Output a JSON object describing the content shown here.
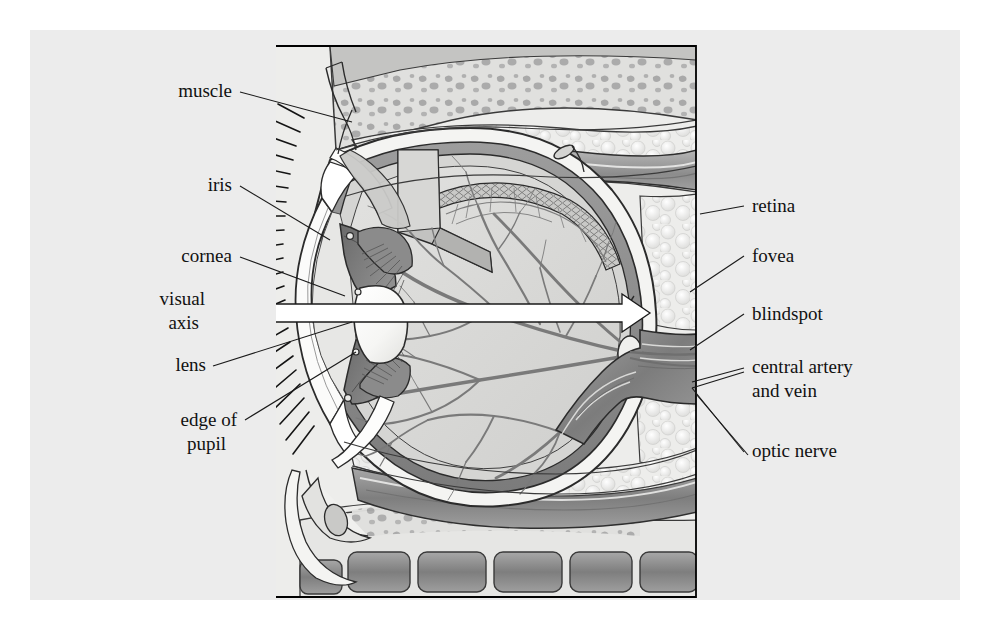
{
  "figure": {
    "background_color": "#ececec",
    "page_color": "#ffffff",
    "frame_color": "#000000",
    "frame": {
      "x": 275,
      "y": 45,
      "width": 422,
      "height": 553
    }
  },
  "labels": {
    "left": [
      {
        "id": "muscle",
        "text": "muscle",
        "x": 232,
        "y": 97,
        "align": "end"
      },
      {
        "id": "iris",
        "text": "iris",
        "x": 232,
        "y": 191,
        "align": "end"
      },
      {
        "id": "cornea",
        "text": "cornea",
        "x": 232,
        "y": 262,
        "align": "end"
      },
      {
        "id": "visual-axis-1",
        "text": "visual",
        "x": 205,
        "y": 305,
        "align": "end"
      },
      {
        "id": "visual-axis-2",
        "text": "axis",
        "x": 199,
        "y": 329,
        "align": "end"
      },
      {
        "id": "lens",
        "text": "lens",
        "x": 206,
        "y": 371,
        "align": "end"
      },
      {
        "id": "edge-of-pupil-1",
        "text": "edge of",
        "x": 237,
        "y": 426,
        "align": "end"
      },
      {
        "id": "edge-of-pupil-2",
        "text": "pupil",
        "x": 226,
        "y": 450,
        "align": "end"
      }
    ],
    "right": [
      {
        "id": "retina",
        "text": "retina",
        "x": 752,
        "y": 212,
        "align": "start"
      },
      {
        "id": "fovea",
        "text": "fovea",
        "x": 752,
        "y": 262,
        "align": "start"
      },
      {
        "id": "blindspot",
        "text": "blindspot",
        "x": 752,
        "y": 320,
        "align": "start"
      },
      {
        "id": "central-artery-1",
        "text": "central artery",
        "x": 752,
        "y": 373,
        "align": "start"
      },
      {
        "id": "central-artery-2",
        "text": "and vein",
        "x": 752,
        "y": 397,
        "align": "start"
      },
      {
        "id": "optic-nerve",
        "text": "optic nerve",
        "x": 752,
        "y": 457,
        "align": "start"
      }
    ]
  },
  "anatomy": {
    "visual_axis_arrow": {
      "name": "visual-axis-arrow",
      "fill": "#ffffff",
      "stroke": "#1a1a1a",
      "x_start": 250,
      "x_end": 648,
      "y": 313
    },
    "structures": [
      "bone",
      "bone-marrow",
      "orbital-fat",
      "extraocular-muscle-superior",
      "extraocular-muscle-inferior",
      "sclera",
      "choroid",
      "retina",
      "vitreous-body",
      "lens",
      "iris",
      "cornea",
      "anterior-chamber",
      "ciliary-body",
      "zonule-fibers",
      "conjunctiva",
      "eyelashes",
      "optic-nerve",
      "central-retinal-vessels",
      "fovea",
      "optic-disc"
    ],
    "palette": {
      "sclera": "#f2f2f0",
      "choroid": "#8e8e8e",
      "retina_vessel": "#7d7d7d",
      "vitreous": "#d8d8d6",
      "iris_dark": "#6e6e6e",
      "iris_mid": "#9a9a9a",
      "lens_light": "#fbfbfa",
      "muscle_gray": "#9b9b9b",
      "muscle_dark": "#7a7a7a",
      "fat_white": "#fafafa",
      "bone_gray": "#cfcfcf",
      "marrow_speck": "#a8a8a8",
      "outline": "#2b2b2b"
    }
  }
}
